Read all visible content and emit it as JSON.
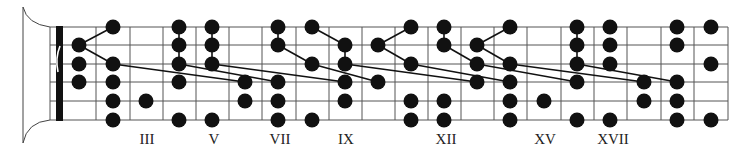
{
  "diagram": {
    "colors": {
      "ink": "#111111",
      "grid": "#555555",
      "background": "#ffffff"
    },
    "strings_y": [
      27,
      45,
      64,
      82,
      101,
      120
    ],
    "board_x_start": 50,
    "nut": {
      "x": 56,
      "width": 7
    },
    "fret_x": [
      96,
      130,
      163,
      196,
      229,
      262,
      296,
      329,
      362,
      395,
      428,
      461,
      494,
      527,
      561,
      594,
      627,
      661,
      694,
      728
    ],
    "fret_centers": [
      79,
      113,
      146,
      179,
      212,
      245,
      278,
      312,
      345,
      378,
      411,
      444,
      477,
      510,
      544,
      577,
      610,
      644,
      677,
      711
    ],
    "dot_radius": 7.5,
    "dots": [
      {
        "string": 1,
        "x": 113
      },
      {
        "string": 1,
        "x": 179
      },
      {
        "string": 1,
        "x": 212
      },
      {
        "string": 1,
        "x": 278
      },
      {
        "string": 1,
        "x": 312
      },
      {
        "string": 1,
        "x": 411
      },
      {
        "string": 1,
        "x": 444
      },
      {
        "string": 1,
        "x": 510
      },
      {
        "string": 1,
        "x": 577
      },
      {
        "string": 1,
        "x": 610
      },
      {
        "string": 1,
        "x": 677
      },
      {
        "string": 1,
        "x": 711
      },
      {
        "string": 2,
        "x": 79
      },
      {
        "string": 2,
        "x": 179
      },
      {
        "string": 2,
        "x": 212
      },
      {
        "string": 2,
        "x": 278
      },
      {
        "string": 2,
        "x": 345
      },
      {
        "string": 2,
        "x": 378
      },
      {
        "string": 2,
        "x": 444
      },
      {
        "string": 2,
        "x": 477
      },
      {
        "string": 2,
        "x": 577
      },
      {
        "string": 2,
        "x": 610
      },
      {
        "string": 2,
        "x": 677
      },
      {
        "string": 3,
        "x": 79
      },
      {
        "string": 3,
        "x": 113
      },
      {
        "string": 3,
        "x": 179
      },
      {
        "string": 3,
        "x": 212
      },
      {
        "string": 3,
        "x": 312
      },
      {
        "string": 3,
        "x": 345
      },
      {
        "string": 3,
        "x": 411
      },
      {
        "string": 3,
        "x": 477
      },
      {
        "string": 3,
        "x": 510
      },
      {
        "string": 3,
        "x": 577
      },
      {
        "string": 3,
        "x": 610
      },
      {
        "string": 3,
        "x": 711
      },
      {
        "string": 4,
        "x": 79
      },
      {
        "string": 4,
        "x": 113
      },
      {
        "string": 4,
        "x": 179
      },
      {
        "string": 4,
        "x": 245
      },
      {
        "string": 4,
        "x": 278
      },
      {
        "string": 4,
        "x": 345
      },
      {
        "string": 4,
        "x": 378
      },
      {
        "string": 4,
        "x": 477
      },
      {
        "string": 4,
        "x": 510
      },
      {
        "string": 4,
        "x": 577
      },
      {
        "string": 4,
        "x": 644
      },
      {
        "string": 4,
        "x": 677
      },
      {
        "string": 5,
        "x": 113
      },
      {
        "string": 5,
        "x": 146
      },
      {
        "string": 5,
        "x": 245
      },
      {
        "string": 5,
        "x": 278
      },
      {
        "string": 5,
        "x": 345
      },
      {
        "string": 5,
        "x": 411
      },
      {
        "string": 5,
        "x": 444
      },
      {
        "string": 5,
        "x": 510
      },
      {
        "string": 5,
        "x": 544
      },
      {
        "string": 5,
        "x": 644
      },
      {
        "string": 5,
        "x": 677
      },
      {
        "string": 6,
        "x": 113
      },
      {
        "string": 6,
        "x": 179
      },
      {
        "string": 6,
        "x": 212
      },
      {
        "string": 6,
        "x": 278
      },
      {
        "string": 6,
        "x": 312
      },
      {
        "string": 6,
        "x": 411
      },
      {
        "string": 6,
        "x": 444
      },
      {
        "string": 6,
        "x": 510
      },
      {
        "string": 6,
        "x": 577
      },
      {
        "string": 6,
        "x": 610
      },
      {
        "string": 6,
        "x": 677
      },
      {
        "string": 6,
        "x": 711
      }
    ],
    "connections": [
      [
        79,
        45,
        113,
        27
      ],
      [
        79,
        45,
        113,
        64
      ],
      [
        113,
        64,
        245,
        82
      ],
      [
        179,
        27,
        179,
        64
      ],
      [
        212,
        27,
        212,
        64
      ],
      [
        179,
        64,
        278,
        82
      ],
      [
        212,
        64,
        345,
        82
      ],
      [
        278,
        27,
        278,
        45
      ],
      [
        278,
        45,
        312,
        64
      ],
      [
        312,
        27,
        345,
        45
      ],
      [
        345,
        45,
        345,
        64
      ],
      [
        312,
        64,
        378,
        82
      ],
      [
        345,
        64,
        477,
        82
      ],
      [
        378,
        45,
        411,
        27
      ],
      [
        378,
        45,
        411,
        64
      ],
      [
        411,
        64,
        510,
        82
      ],
      [
        444,
        27,
        444,
        45
      ],
      [
        444,
        45,
        477,
        64
      ],
      [
        477,
        45,
        510,
        27
      ],
      [
        477,
        45,
        510,
        64
      ],
      [
        477,
        64,
        577,
        82
      ],
      [
        510,
        64,
        644,
        82
      ],
      [
        577,
        27,
        577,
        64
      ],
      [
        577,
        64,
        677,
        82
      ]
    ],
    "position_labels": [
      {
        "text": "III",
        "x": 147
      },
      {
        "text": "V",
        "x": 214
      },
      {
        "text": "VII",
        "x": 280
      },
      {
        "text": "IX",
        "x": 346
      },
      {
        "text": "XII",
        "x": 446
      },
      {
        "text": "XV",
        "x": 545
      },
      {
        "text": "XVII",
        "x": 613
      }
    ]
  }
}
